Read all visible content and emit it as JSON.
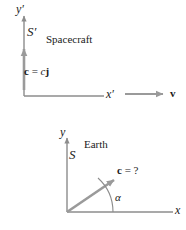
{
  "figure": {
    "axis_color": "#8c8c8c",
    "text_color": "#1a1a1a",
    "background": "#ffffff",
    "width": 186,
    "height": 230
  },
  "top_panel": {
    "name": "spacecraft-frame",
    "frame_label": "S′",
    "frame_caption": "Spacecraft",
    "y_axis_label": "y′",
    "x_axis_label": "x′",
    "vector_label_c": "c",
    "vector_label_eq": " = ",
    "vector_label_cj_scalar": "c",
    "vector_label_jhat": "j",
    "velocity_label": "v"
  },
  "bottom_panel": {
    "name": "earth-frame",
    "frame_label": "S",
    "frame_caption": "Earth",
    "y_axis_label": "y",
    "x_axis_label": "x",
    "vector_label_c": "c",
    "vector_label_eq": " = ",
    "vector_label_unknown": "?",
    "angle_label": "α"
  }
}
